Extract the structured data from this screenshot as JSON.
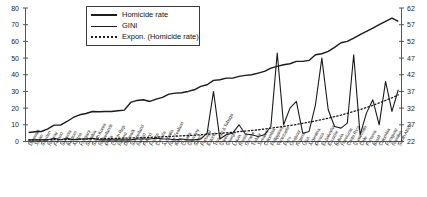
{
  "chart_data": {
    "type": "line",
    "title": "",
    "xlabel": "",
    "ylabel": "",
    "y2label": "",
    "ylim": [
      0,
      80
    ],
    "y2lim": [
      22,
      62
    ],
    "grid": false,
    "legend_position": "top-center",
    "yticks": [
      0,
      10,
      20,
      30,
      40,
      50,
      60,
      70,
      80
    ],
    "y2ticks": [
      22,
      27,
      32,
      37,
      42,
      47,
      52,
      57,
      62
    ],
    "categories": [
      "Denmark",
      "Japan",
      "Sweden",
      "Norway",
      "Finland",
      "Slovenia",
      "Belgium",
      "Austria",
      "Hungary",
      "Slovakia",
      "South Korea",
      "Netherlands",
      "Malta",
      "Czech Rep.",
      "Iceland",
      "Denmark2",
      "Switzerland",
      "Ireland",
      "Poland",
      "France",
      "Canada",
      "Australia",
      "New Zealand",
      "Italy",
      "Croatia",
      "Germany",
      "Spain",
      "Portugal",
      "Estonia",
      "Trinidad & Tobago",
      "Greece",
      "Georgia",
      "Latvia",
      "Russia",
      "Ukraine",
      "Turkey",
      "Jamaica",
      "Colombia",
      "Philippines",
      "Venezuela",
      "Peru",
      "Uruguay",
      "Nigeria",
      "USA",
      "Argentina",
      "Mexico",
      "El Salvador",
      "Ecuador",
      "Bolivia",
      "Honduras",
      "Costa Rica",
      "Guatemala",
      "Chile",
      "Panama",
      "Brazil",
      "Colombia2",
      "Paraguay",
      "Namibia",
      "South Africa"
    ],
    "series": [
      {
        "name": "Homicide rate",
        "axis": "left",
        "style": "solid",
        "values": [
          1.0,
          1.0,
          1.0,
          1.0,
          2.0,
          1.0,
          2.0,
          1.0,
          1.5,
          1.5,
          2.0,
          1.0,
          1.0,
          1.0,
          1.0,
          1.0,
          1.0,
          1.5,
          1.5,
          1.5,
          2.0,
          1.5,
          1.5,
          1.0,
          1.5,
          1.0,
          1.0,
          1.5,
          5.0,
          30.0,
          1.5,
          4.0,
          5.0,
          10.0,
          4.5,
          4.0,
          3.0,
          4.0,
          9.0,
          53.0,
          10.0,
          20.0,
          24.0,
          5.0,
          6.0,
          22.0,
          50.0,
          19.0,
          9.0,
          8.0,
          11.0,
          52.0,
          4.0,
          17.0,
          25.0,
          10.0,
          36.0,
          18.0,
          31.0
        ]
      },
      {
        "name": "GINI",
        "axis": "right",
        "style": "solid",
        "values": [
          24.7,
          24.9,
          25.0,
          25.8,
          26.9,
          26.9,
          28.0,
          29.2,
          30.0,
          30.4,
          31.0,
          30.9,
          31.0,
          31.0,
          31.2,
          31.4,
          33.7,
          34.3,
          34.5,
          34.0,
          34.7,
          35.2,
          36.2,
          36.5,
          36.6,
          37.0,
          37.5,
          38.5,
          39.0,
          40.3,
          40.5,
          41.0,
          41.0,
          41.5,
          41.8,
          42.0,
          42.5,
          43.0,
          44.0,
          44.5,
          45.0,
          45.3,
          46.0,
          46.0,
          46.3,
          48.0,
          48.3,
          49.0,
          50.2,
          51.6,
          52.0,
          53.0,
          54.0,
          55.0,
          56.0,
          57.0,
          58.0,
          59.0,
          58.0
        ]
      },
      {
        "name": "Expon. (Homicide rate)",
        "axis": "left",
        "style": "dotted",
        "values": [
          0.9,
          0.95,
          1.0,
          1.05,
          1.1,
          1.15,
          1.2,
          1.3,
          1.35,
          1.4,
          1.5,
          1.6,
          1.7,
          1.8,
          1.9,
          2.0,
          2.1,
          2.2,
          2.35,
          2.5,
          2.65,
          2.8,
          3.0,
          3.2,
          3.4,
          3.6,
          3.8,
          4.1,
          4.3,
          4.6,
          4.9,
          5.2,
          5.5,
          5.9,
          6.2,
          6.6,
          7.0,
          7.5,
          8.0,
          8.5,
          9.0,
          9.6,
          10.2,
          10.9,
          11.6,
          12.3,
          13.1,
          14.0,
          14.9,
          15.8,
          16.9,
          18.0,
          19.1,
          20.4,
          21.7,
          23.1,
          24.6,
          26.2,
          27.9
        ]
      }
    ]
  },
  "legend": {
    "items": [
      {
        "label": "Homicide rate",
        "key": "solid-line"
      },
      {
        "label": "GINI",
        "key": "solid-line"
      },
      {
        "label": "Expon. (Homicide rate)",
        "key": "dotted-line"
      }
    ]
  },
  "colors": {
    "line": "#1a1a1a",
    "axis": "#555555",
    "text": "#1f1f1f"
  }
}
